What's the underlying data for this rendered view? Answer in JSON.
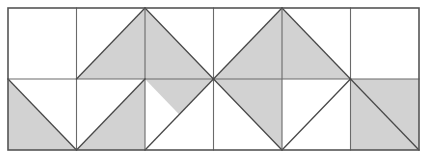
{
  "figure": {
    "type": "geometric-tiling-diagram",
    "canvas": {
      "width": 426,
      "height": 159
    },
    "background_color": "#ffffff"
  },
  "grid": {
    "columns": 6,
    "rows": 2,
    "origin_x": 8,
    "origin_y": 8,
    "cell_width": 68.5,
    "cell_height": 71,
    "outer_stroke_color": "#555555",
    "outer_stroke_width": 1.6,
    "inner_stroke_color": "#6a6a6a",
    "inner_stroke_width": 1.1,
    "diagonal_stroke_color": "#4a4a4a",
    "diagonal_stroke_width": 1.3
  },
  "palette": {
    "shaded_fill": "#d2d2d2",
    "unshaded_fill": "#ffffff",
    "line": "#555555"
  },
  "cells": [
    {
      "id": "r1c1",
      "row": 1,
      "col": 1,
      "shape": "empty",
      "label": "top row column 1 unshaded square"
    },
    {
      "id": "r1c2",
      "row": 1,
      "col": 2,
      "shape": "tri-br",
      "label": "top row column 2 shaded lower-right triangle"
    },
    {
      "id": "r1c3",
      "row": 1,
      "col": 3,
      "shape": "tri-bl",
      "label": "top row column 3 shaded lower-left triangle"
    },
    {
      "id": "r1c4",
      "row": 1,
      "col": 4,
      "shape": "tri-br",
      "label": "top row column 4 shaded lower-right triangle"
    },
    {
      "id": "r1c5",
      "row": 1,
      "col": 5,
      "shape": "tri-bl",
      "label": "top row column 5 shaded lower-left triangle"
    },
    {
      "id": "r1c6",
      "row": 1,
      "col": 6,
      "shape": "empty",
      "label": "top row column 6 unshaded square"
    },
    {
      "id": "r2c1",
      "row": 2,
      "col": 1,
      "shape": "tri-bl",
      "label": "bottom row column 1 shaded lower-left triangle"
    },
    {
      "id": "r2c2",
      "row": 2,
      "col": 2,
      "shape": "tri-full-diag-br",
      "label": "bottom row column 2 shaded square with diagonal"
    },
    {
      "id": "r2c3",
      "row": 2,
      "col": 3,
      "shape": "tri-tr",
      "label": "bottom row column 3 shaded upper-right triangle"
    },
    {
      "id": "r2c4",
      "row": 2,
      "col": 4,
      "shape": "tri-tl",
      "label": "bottom row column 4 shaded upper-left triangle"
    },
    {
      "id": "r2c5",
      "row": 2,
      "col": 5,
      "shape": "tri-tr-white",
      "label": "bottom row column 5 unshaded upper-right triangle"
    },
    {
      "id": "r2c6",
      "row": 2,
      "col": 6,
      "shape": "tri-full-diag-tr",
      "label": "bottom row column 6 shaded square with diagonal"
    }
  ],
  "shaded_polygons": [
    {
      "name": "top-c2-lower-right",
      "points": "76.5,79 145,8 145,79"
    },
    {
      "name": "top-c3-lower-left",
      "points": "145,8 145,79 213.5,79"
    },
    {
      "name": "top-c4-lower-right",
      "points": "213.5,79 282,8 282,79"
    },
    {
      "name": "top-c5-lower-left",
      "points": "282,8 282,79 350.5,79"
    },
    {
      "name": "bot-c1-lower-left",
      "points": "8,79 8,150 76.5,150"
    },
    {
      "name": "bot-c1-lower-right",
      "points": "8,150 76.5,150 76.5,79"
    },
    {
      "name": "bot-c2-square",
      "points": "76.5,79 145,79 145,150 76.5,150"
    },
    {
      "name": "bot-c3-upper-right",
      "points": "145,79 213.5,79 145,150"
    },
    {
      "name": "bot-c4-upper-left",
      "points": "213.5,79 282,79 282,150"
    },
    {
      "name": "bot-c6-square",
      "points": "350.5,79 419,79 419,150 350.5,150"
    }
  ],
  "unshaded_polygons": [
    {
      "name": "bot-c1-upper-right",
      "points": "8,79 76.5,79 76.5,150"
    },
    {
      "name": "bot-c2-upper-left",
      "points": "76.5,79 145,79 76.5,150"
    },
    {
      "name": "bot-c3-lower-left",
      "points": "145,79 145,150 213.5,150"
    },
    {
      "name": "bot-c5-upper-right",
      "points": "282,79 350.5,79 282,150"
    }
  ],
  "lines": {
    "outer_rect": {
      "x": 8,
      "y": 8,
      "width": 411,
      "height": 142
    },
    "verticals_x": [
      76.5,
      145,
      213.5,
      282,
      350.5
    ],
    "horizontals_y": [
      79
    ],
    "diagonals": [
      {
        "name": "d-t2",
        "x1": 76.5,
        "y1": 79,
        "x2": 145,
        "y2": 8
      },
      {
        "name": "d-t3",
        "x1": 145,
        "y1": 8,
        "x2": 213.5,
        "y2": 79
      },
      {
        "name": "d-t4",
        "x1": 213.5,
        "y1": 79,
        "x2": 282,
        "y2": 8
      },
      {
        "name": "d-t5",
        "x1": 282,
        "y1": 8,
        "x2": 350.5,
        "y2": 79
      },
      {
        "name": "d-b1",
        "x1": 8,
        "y1": 79,
        "x2": 76.5,
        "y2": 150
      },
      {
        "name": "d-b2",
        "x1": 145,
        "y1": 79,
        "x2": 76.5,
        "y2": 150
      },
      {
        "name": "d-b3",
        "x1": 145,
        "y1": 150,
        "x2": 213.5,
        "y2": 79
      },
      {
        "name": "d-b4",
        "x1": 213.5,
        "y1": 79,
        "x2": 282,
        "y2": 150
      },
      {
        "name": "d-b5",
        "x1": 282,
        "y1": 150,
        "x2": 350.5,
        "y2": 79
      },
      {
        "name": "d-b6",
        "x1": 350.5,
        "y1": 79,
        "x2": 419,
        "y2": 150
      }
    ]
  }
}
